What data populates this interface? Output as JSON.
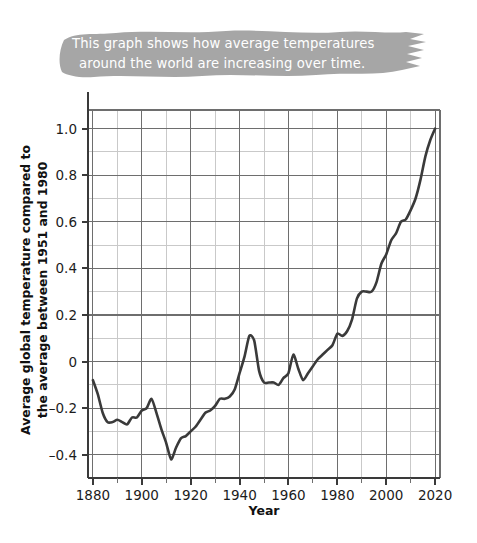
{
  "annotation": {
    "line1": "This graph shows how average temperatures",
    "line2": "around the world are increasing over time.",
    "brush_color": "#a6a6a6",
    "text_color": "#ffffff"
  },
  "chart_data": {
    "type": "line",
    "title": "",
    "xlabel": "Year",
    "ylabel": "Average global temperature compared to the average between 1951 and 1980",
    "ylabel_line1": "Average global temperature compared to",
    "ylabel_line2": "the average between 1951 and 1980",
    "xlim": [
      1878,
      2022
    ],
    "ylim": [
      -0.5,
      1.08
    ],
    "xticks": [
      1880,
      1900,
      1920,
      1940,
      1960,
      1980,
      2000,
      2020
    ],
    "xtick_labels": [
      "1880",
      "1900",
      "1920",
      "1940",
      "1960",
      "1980",
      "2000",
      "2020"
    ],
    "xminor_step": 10,
    "yticks": [
      -0.4,
      -0.2,
      0,
      0.2,
      0.4,
      0.6,
      0.8,
      1.0
    ],
    "ytick_labels": [
      "–0.4",
      "–0.2",
      "0",
      "0.2",
      "0.4",
      "0.6",
      "0.8",
      "1.0"
    ],
    "yminor_step": 0.1,
    "grid": true,
    "grid_major_color": "#6e6e6e",
    "grid_minor_color": "#c9c9c9",
    "line_color": "#3a3a3a",
    "line_width": 2.6,
    "legend": null,
    "x": [
      1880,
      1882,
      1884,
      1886,
      1888,
      1890,
      1892,
      1894,
      1896,
      1898,
      1900,
      1902,
      1904,
      1906,
      1908,
      1910,
      1912,
      1914,
      1916,
      1918,
      1920,
      1922,
      1924,
      1926,
      1928,
      1930,
      1932,
      1934,
      1936,
      1938,
      1940,
      1942,
      1944,
      1946,
      1948,
      1950,
      1952,
      1954,
      1956,
      1958,
      1960,
      1962,
      1964,
      1966,
      1968,
      1970,
      1972,
      1974,
      1976,
      1978,
      1980,
      1982,
      1984,
      1986,
      1988,
      1990,
      1992,
      1994,
      1996,
      1998,
      2000,
      2002,
      2004,
      2006,
      2008,
      2010,
      2012,
      2014,
      2016,
      2018,
      2020
    ],
    "values": [
      -0.08,
      -0.14,
      -0.22,
      -0.26,
      -0.26,
      -0.25,
      -0.26,
      -0.27,
      -0.24,
      -0.24,
      -0.21,
      -0.2,
      -0.16,
      -0.22,
      -0.29,
      -0.35,
      -0.42,
      -0.37,
      -0.33,
      -0.32,
      -0.3,
      -0.28,
      -0.25,
      -0.22,
      -0.21,
      -0.19,
      -0.16,
      -0.16,
      -0.15,
      -0.12,
      -0.05,
      0.02,
      0.11,
      0.09,
      -0.04,
      -0.09,
      -0.09,
      -0.09,
      -0.1,
      -0.07,
      -0.05,
      0.03,
      -0.03,
      -0.08,
      -0.05,
      -0.02,
      0.01,
      0.03,
      0.05,
      0.07,
      0.12,
      0.11,
      0.13,
      0.18,
      0.27,
      0.3,
      0.3,
      0.3,
      0.34,
      0.42,
      0.46,
      0.52,
      0.55,
      0.6,
      0.61,
      0.65,
      0.7,
      0.78,
      0.88,
      0.95,
      1.0
    ]
  }
}
